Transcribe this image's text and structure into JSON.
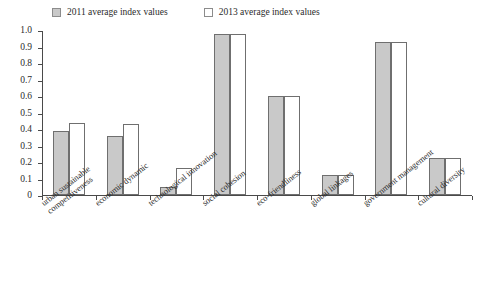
{
  "chart_data": {
    "type": "bar",
    "title": "",
    "subtitle": "",
    "xlabel": "",
    "ylabel": "",
    "ylim": [
      0,
      1.0
    ],
    "ytick_labels": [
      "1.0",
      "0.9",
      "0.8",
      "0.7",
      "0.6",
      "0.5",
      "0.4",
      "0.3",
      "0.2",
      "0.1",
      "0"
    ],
    "ytick_values": [
      1.0,
      0.9,
      0.8,
      0.7,
      0.6,
      0.5,
      0.4,
      0.3,
      0.2,
      0.1,
      0
    ],
    "grid": false,
    "legend_position": "top-left",
    "categories": [
      "urban sustainable competitiveness",
      "economic dynamic",
      "technological innovation",
      "social cohesion",
      "eco-friendliness",
      "global linkages",
      "government management",
      "cultural diversity"
    ],
    "category_lines": [
      [
        "urban sustainable",
        "competitiveness"
      ],
      [
        "economic dynamic"
      ],
      [
        "technological innovation"
      ],
      [
        "social cohesion"
      ],
      [
        "eco-friendliness"
      ],
      [
        "global linkages"
      ],
      [
        "government management"
      ],
      [
        "cultural diversity"
      ]
    ],
    "series": [
      {
        "name": "2011 average index values",
        "color": "#c9c9c9",
        "values": [
          0.385,
          0.355,
          0.05,
          0.975,
          0.6,
          0.12,
          0.93,
          0.225
        ]
      },
      {
        "name": "2013 average index values",
        "color": "#ffffff",
        "values": [
          0.435,
          0.43,
          0.165,
          0.975,
          0.6,
          0.12,
          0.93,
          0.225
        ]
      }
    ]
  },
  "legend": {
    "entries": [
      {
        "label": "2011 average index values",
        "style": "filled"
      },
      {
        "label": "2013 average index values",
        "style": "hollow"
      }
    ]
  },
  "colors": {
    "bar_2011_fill": "#c9c9c9",
    "bar_2013_fill": "#ffffff",
    "bar_border": "#6f6f6f",
    "axis": "#4a4a4a",
    "text": "#2b2b2b",
    "background": "#ffffff"
  }
}
